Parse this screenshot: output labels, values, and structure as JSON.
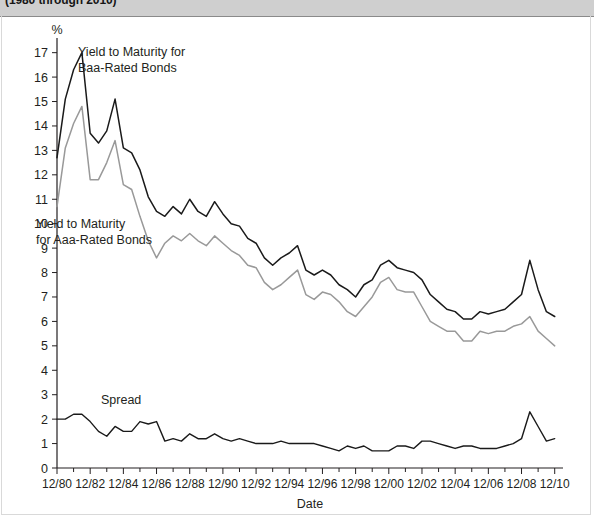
{
  "caption": {
    "text": "(1980 through 2010)"
  },
  "axis": {
    "y_unit": "%",
    "x_title": "Date",
    "y_ticks": [
      0,
      1,
      2,
      3,
      4,
      5,
      6,
      7,
      8,
      9,
      10,
      11,
      12,
      13,
      14,
      15,
      16,
      17
    ],
    "x_ticklabels": [
      "12/80",
      "12/82",
      "12/84",
      "12/86",
      "12/88",
      "12/90",
      "12/92",
      "12/94",
      "12/96",
      "12/98",
      "12/00",
      "12/02",
      "12/04",
      "12/06",
      "12/08",
      "12/10"
    ]
  },
  "annotations": {
    "baa": "Yield to Maturity for\nBaa-Rated Bonds",
    "baa_line1": "Yield to Maturity for",
    "baa_line2": "Baa-Rated Bonds",
    "aaa_line1": "Yield to Maturity",
    "aaa_line2": "for Aaa-Rated Bonds",
    "spread": "Spread"
  },
  "colors": {
    "baa": "#1a1a1a",
    "aaa": "#999999",
    "spread": "#1a1a1a",
    "axis": "#231f20",
    "caption_band": "#cfcfcf"
  },
  "chart_data": {
    "type": "line",
    "title": "(1980 through 2010)",
    "xlabel": "Date",
    "ylabel": "%",
    "ylim": [
      0,
      17.6
    ],
    "xlim": [
      1980,
      2010.5
    ],
    "grid": false,
    "legend": "inline-annotations",
    "x": [
      1980,
      1980.5,
      1981,
      1981.5,
      1982,
      1982.5,
      1983,
      1983.5,
      1984,
      1984.5,
      1985,
      1985.5,
      1986,
      1986.5,
      1987,
      1987.5,
      1988,
      1988.5,
      1989,
      1989.5,
      1990,
      1990.5,
      1991,
      1991.5,
      1992,
      1992.5,
      1993,
      1993.5,
      1994,
      1994.5,
      1995,
      1995.5,
      1996,
      1996.5,
      1997,
      1997.5,
      1998,
      1998.5,
      1999,
      1999.5,
      2000,
      2000.5,
      2001,
      2001.5,
      2002,
      2002.5,
      2003,
      2003.5,
      2004,
      2004.5,
      2005,
      2005.5,
      2006,
      2006.5,
      2007,
      2007.5,
      2008,
      2008.5,
      2009,
      2009.5,
      2010
    ],
    "series": [
      {
        "name": "Yield to Maturity for Baa-Rated Bonds",
        "color": "#1a1a1a",
        "values": [
          12.7,
          15.1,
          16.3,
          17.0,
          13.7,
          13.3,
          13.8,
          15.1,
          13.1,
          12.9,
          12.2,
          11.1,
          10.5,
          10.3,
          10.7,
          10.4,
          11.0,
          10.5,
          10.3,
          10.9,
          10.4,
          10.0,
          9.9,
          9.4,
          9.2,
          8.6,
          8.3,
          8.6,
          8.8,
          9.1,
          8.1,
          7.9,
          8.1,
          7.9,
          7.5,
          7.3,
          7.0,
          7.5,
          7.7,
          8.3,
          8.5,
          8.2,
          8.1,
          8.0,
          7.7,
          7.1,
          6.8,
          6.5,
          6.4,
          6.1,
          6.1,
          6.4,
          6.3,
          6.4,
          6.5,
          6.8,
          7.1,
          8.5,
          7.3,
          6.4,
          6.2
        ]
      },
      {
        "name": "Yield to Maturity for Aaa-Rated Bonds",
        "color": "#999999",
        "values": [
          10.7,
          13.1,
          14.1,
          14.8,
          11.8,
          11.8,
          12.5,
          13.4,
          11.6,
          11.4,
          10.3,
          9.3,
          8.6,
          9.2,
          9.5,
          9.3,
          9.6,
          9.3,
          9.1,
          9.5,
          9.2,
          8.9,
          8.7,
          8.3,
          8.2,
          7.6,
          7.3,
          7.5,
          7.8,
          8.1,
          7.1,
          6.9,
          7.2,
          7.1,
          6.8,
          6.4,
          6.2,
          6.6,
          7.0,
          7.6,
          7.8,
          7.3,
          7.2,
          7.2,
          6.6,
          6.0,
          5.8,
          5.6,
          5.6,
          5.2,
          5.2,
          5.6,
          5.5,
          5.6,
          5.6,
          5.8,
          5.9,
          6.2,
          5.6,
          5.3,
          5.0
        ]
      },
      {
        "name": "Spread",
        "color": "#1a1a1a",
        "values": [
          2.0,
          2.0,
          2.2,
          2.2,
          1.9,
          1.5,
          1.3,
          1.7,
          1.5,
          1.5,
          1.9,
          1.8,
          1.9,
          1.1,
          1.2,
          1.1,
          1.4,
          1.2,
          1.2,
          1.4,
          1.2,
          1.1,
          1.2,
          1.1,
          1.0,
          1.0,
          1.0,
          1.1,
          1.0,
          1.0,
          1.0,
          1.0,
          0.9,
          0.8,
          0.7,
          0.9,
          0.8,
          0.9,
          0.7,
          0.7,
          0.7,
          0.9,
          0.9,
          0.8,
          1.1,
          1.1,
          1.0,
          0.9,
          0.8,
          0.9,
          0.9,
          0.8,
          0.8,
          0.8,
          0.9,
          1.0,
          1.2,
          2.3,
          1.7,
          1.1,
          1.2
        ]
      }
    ]
  }
}
